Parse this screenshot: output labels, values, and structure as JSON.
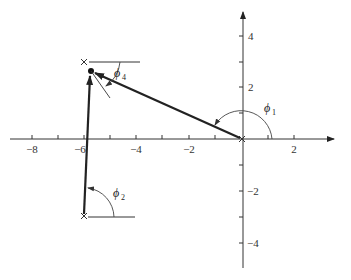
{
  "diagram": {
    "type": "root-locus-angle-diagram",
    "axes": {
      "x_ticks": [
        {
          "value": -8,
          "label": "−8"
        },
        {
          "value": -6,
          "label": "−6"
        },
        {
          "value": -4,
          "label": "−4"
        },
        {
          "value": -2,
          "label": "−2"
        },
        {
          "value": 2,
          "label": "2"
        }
      ],
      "y_ticks": [
        {
          "value": 4,
          "label": "4"
        },
        {
          "value": 2,
          "label": "2"
        },
        {
          "value": -2,
          "label": "−2"
        },
        {
          "value": -4,
          "label": "−4"
        }
      ]
    },
    "poles": [
      {
        "name": "pole-origin",
        "x": 0,
        "y": 0
      },
      {
        "name": "pole-upper",
        "x": -6,
        "y": 3
      },
      {
        "name": "pole-lower",
        "x": -6,
        "y": -3
      }
    ],
    "test_point": {
      "x": -5.7,
      "y": 2.6
    },
    "angles": [
      {
        "id": "phi1",
        "symbol": "ϕ",
        "subscript": "1"
      },
      {
        "id": "phi2",
        "symbol": "ϕ",
        "subscript": "2"
      },
      {
        "id": "phi4",
        "symbol": "ϕ",
        "subscript": "4"
      }
    ]
  }
}
